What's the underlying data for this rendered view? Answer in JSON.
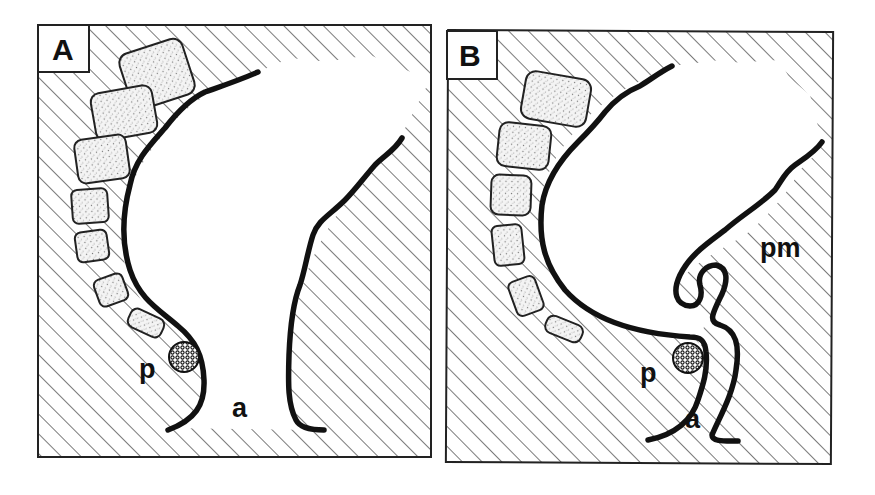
{
  "figure": {
    "type": "anatomical-schematic",
    "colors": {
      "ink": "#111111",
      "background": "#ffffff",
      "hatch": "#333333"
    },
    "panels": [
      {
        "id": "A",
        "label": "A",
        "annotations": {
          "puborectalis": "p",
          "anal_canal": "a"
        }
      },
      {
        "id": "B",
        "label": "B",
        "annotations": {
          "puborectalis": "p",
          "anal_canal": "a",
          "perineum_or_pelvic_muscle": "pm"
        }
      }
    ]
  }
}
